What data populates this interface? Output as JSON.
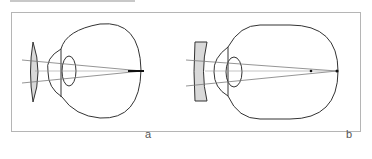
{
  "figure": {
    "panels": [
      {
        "id": "a",
        "label": "a",
        "lens_type": "convex",
        "description": "eye with convex correcting lens"
      },
      {
        "id": "b",
        "label": "b",
        "lens_type": "concave",
        "description": "eye with concave correcting lens"
      }
    ],
    "colors": {
      "outline": "#333333",
      "lens_fill": "#d9d9d9",
      "ray": "#7a7a7a",
      "frame": "#b5b5b5"
    }
  }
}
